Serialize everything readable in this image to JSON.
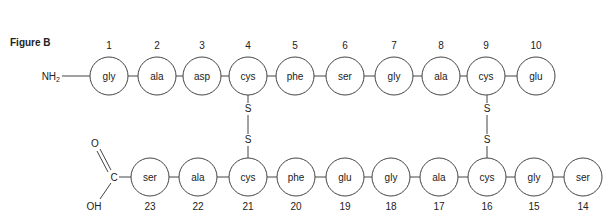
{
  "figure": {
    "label": "Figure B",
    "n_terminus": "NH",
    "n_terminus_sub": "2",
    "c_terminus": {
      "carbon": "C",
      "oxygen": "O",
      "hydroxyl": "OH"
    },
    "top_chain": [
      {
        "num": "1",
        "residue": "gly",
        "x": 109
      },
      {
        "num": "2",
        "residue": "ala",
        "x": 157
      },
      {
        "num": "3",
        "residue": "asp",
        "x": 202
      },
      {
        "num": "4",
        "residue": "cys",
        "x": 248
      },
      {
        "num": "5",
        "residue": "phe",
        "x": 295
      },
      {
        "num": "6",
        "residue": "ser",
        "x": 345
      },
      {
        "num": "7",
        "residue": "gly",
        "x": 394
      },
      {
        "num": "8",
        "residue": "ala",
        "x": 441
      },
      {
        "num": "9",
        "residue": "cys",
        "x": 486
      },
      {
        "num": "10",
        "residue": "glu",
        "x": 536
      }
    ],
    "bottom_chain": [
      {
        "num": "23",
        "residue": "ser",
        "x": 150
      },
      {
        "num": "22",
        "residue": "ala",
        "x": 198
      },
      {
        "num": "21",
        "residue": "cys",
        "x": 248
      },
      {
        "num": "20",
        "residue": "phe",
        "x": 296
      },
      {
        "num": "19",
        "residue": "glu",
        "x": 345
      },
      {
        "num": "18",
        "residue": "gly",
        "x": 391
      },
      {
        "num": "17",
        "residue": "ala",
        "x": 439
      },
      {
        "num": "16",
        "residue": "cys",
        "x": 487
      },
      {
        "num": "15",
        "residue": "gly",
        "x": 534
      },
      {
        "num": "14",
        "residue": "ser",
        "x": 583
      }
    ],
    "disulfide_bonds": [
      {
        "from": "4",
        "to": "21",
        "atom": "S",
        "x": 248
      },
      {
        "from": "9",
        "to": "16",
        "atom": "S",
        "x": 487
      }
    ]
  }
}
